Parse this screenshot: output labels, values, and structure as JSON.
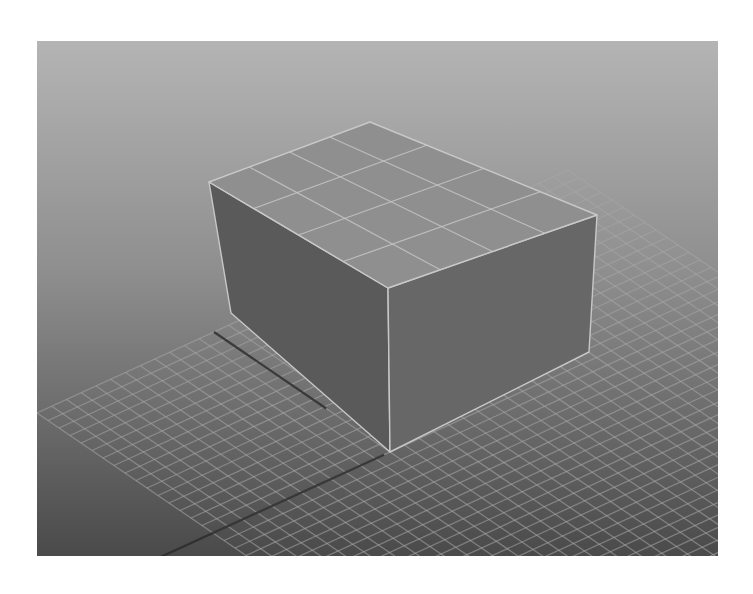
{
  "viewport": {
    "x": 37,
    "y": 41,
    "width": 681,
    "height": 515,
    "background": {
      "top": "#b4b4b4",
      "mid": "#8e8e8e",
      "bottom": "#4a4a4a"
    }
  },
  "ground_grid": {
    "line_color": "#a8a8a8",
    "line_opacity": 0.55,
    "axis_color": "#2c2c2c",
    "origin": [
      390,
      452
    ],
    "u_vec": [
      29.5,
      -13.5
    ],
    "v_vec": [
      -22.0,
      -15.0
    ],
    "u_range": [
      -6,
      12
    ],
    "v_range": [
      -12,
      8
    ],
    "axis_u": {
      "from": [
        -11,
        0
      ],
      "to": [
        -0.2,
        0
      ]
    },
    "axis_v": {
      "from": [
        0,
        2.9
      ],
      "to": [
        0,
        8
      ]
    }
  },
  "cube": {
    "edge_color": "#c8c8c8",
    "top_face": {
      "points": [
        [
          209,
          182
        ],
        [
          370,
          122
        ],
        [
          597,
          215
        ],
        [
          388,
          288
        ]
      ],
      "fill": "#8f8f8f",
      "subdivisions": 4
    },
    "left_face": {
      "points": [
        [
          209,
          182
        ],
        [
          388,
          288
        ],
        [
          390,
          452
        ],
        [
          231,
          313
        ]
      ],
      "fill": "#5a5a5a"
    },
    "right_face": {
      "points": [
        [
          388,
          288
        ],
        [
          597,
          215
        ],
        [
          589,
          352
        ],
        [
          390,
          452
        ]
      ],
      "fill": "#676767"
    }
  }
}
